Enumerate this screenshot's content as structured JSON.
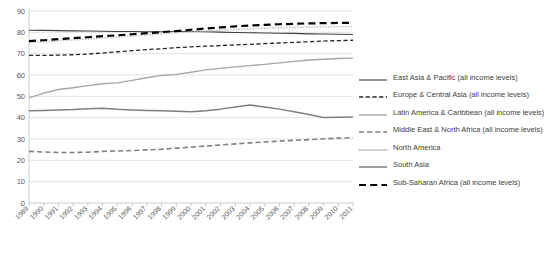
{
  "chart_data": {
    "type": "line",
    "title": "",
    "xlabel": "",
    "ylabel": "",
    "ylim": [
      0,
      90
    ],
    "ytick_values": [
      0,
      10,
      20,
      30,
      40,
      50,
      60,
      70,
      80,
      90
    ],
    "grid": true,
    "legend_position": "right",
    "categories": [
      "1989",
      "1990",
      "1991",
      "1992",
      "1993",
      "1994",
      "1995",
      "1996",
      "1997",
      "1998",
      "1999",
      "2000",
      "2001",
      "2002",
      "2003",
      "2004",
      "2005",
      "2006",
      "2007",
      "2008",
      "2009",
      "2010",
      "2011"
    ],
    "series": [
      {
        "name": "East Asia & Pacific (all income levels)",
        "style": "solid",
        "color": "#3f3f3f",
        "width": 1.1,
        "values": [
          81.0,
          80.9,
          80.8,
          80.7,
          80.6,
          80.5,
          80.4,
          80.4,
          80.3,
          80.3,
          80.4,
          80.4,
          80.3,
          80.1,
          79.9,
          79.8,
          79.7,
          79.6,
          79.5,
          79.3,
          79.2,
          79.1,
          79.0
        ]
      },
      {
        "name": "Europe & Central Asia (all income levels)",
        "style": "dashed",
        "color": "#262626",
        "width": 1.3,
        "values": [
          69.2,
          69.2,
          69.3,
          69.5,
          69.8,
          70.3,
          70.9,
          71.4,
          71.9,
          72.3,
          72.8,
          73.2,
          73.5,
          73.8,
          74.1,
          74.4,
          74.7,
          75.0,
          75.3,
          75.6,
          75.9,
          76.1,
          76.3
        ]
      },
      {
        "name": "Latin America & Caribbean (all income levels)",
        "style": "solid",
        "color": "#a6a6a6",
        "width": 1.4,
        "values": [
          49.3,
          51.5,
          53.2,
          54.0,
          55.0,
          55.9,
          56.3,
          57.5,
          58.7,
          59.8,
          60.3,
          61.3,
          62.4,
          63.1,
          63.8,
          64.4,
          65.0,
          65.7,
          66.4,
          67.0,
          67.4,
          67.7,
          67.9
        ]
      },
      {
        "name": "Middle East & North Africa (all income levels)",
        "style": "dashed",
        "color": "#808080",
        "width": 1.6,
        "values": [
          24.2,
          23.9,
          23.7,
          23.7,
          23.8,
          24.2,
          24.4,
          24.6,
          24.9,
          25.2,
          25.7,
          26.2,
          26.7,
          27.2,
          27.7,
          28.2,
          28.6,
          29.0,
          29.4,
          29.7,
          30.1,
          30.4,
          30.6
        ]
      },
      {
        "name": "North America",
        "style": "dotted",
        "color": "#bfbfbf",
        "width": 1.5,
        "values": [
          75.2,
          75.6,
          76.0,
          76.4,
          76.8,
          77.3,
          77.8,
          78.3,
          78.8,
          79.3,
          79.8,
          80.2,
          80.6,
          81.0,
          81.3,
          81.6,
          81.9,
          82.1,
          82.3,
          82.5,
          82.6,
          82.7,
          82.8
        ]
      },
      {
        "name": "South Asia",
        "style": "solid",
        "color": "#7f7f7f",
        "width": 1.5,
        "values": [
          43.2,
          43.4,
          43.6,
          43.8,
          44.2,
          44.4,
          43.9,
          43.6,
          43.4,
          43.2,
          43.0,
          42.8,
          43.3,
          44.0,
          45.0,
          45.9,
          45.0,
          44.0,
          42.8,
          41.5,
          40.1,
          40.2,
          40.3
        ]
      },
      {
        "name": "Sub-Saharan Africa (all income levels)",
        "style": "dashed",
        "color": "#000000",
        "width": 2.2,
        "values": [
          75.9,
          76.3,
          76.8,
          77.3,
          77.7,
          78.2,
          78.6,
          79.1,
          79.6,
          80.1,
          80.6,
          81.2,
          81.8,
          82.3,
          82.8,
          83.2,
          83.5,
          83.8,
          84.0,
          84.2,
          84.3,
          84.4,
          84.4
        ]
      }
    ]
  },
  "legend": {
    "items": [
      {
        "label": "East Asia & Pacific (all income levels)"
      },
      {
        "label": "Europe & Central Asia (all income levels)"
      },
      {
        "label": "Latin America & Caribbean (all income levels)"
      },
      {
        "label": "Middle East & North Africa (all income levels)"
      },
      {
        "label": "North America"
      },
      {
        "label": "South Asia"
      },
      {
        "label": "Sub-Saharan Africa (all income levels)"
      }
    ]
  }
}
